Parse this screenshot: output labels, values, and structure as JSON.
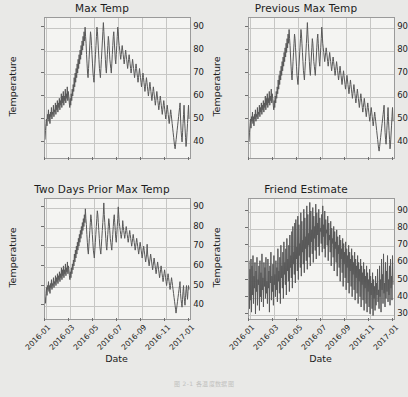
{
  "figure": {
    "caption": "图 2-1  各温度数据图",
    "background_color": "#e9e9e7",
    "plot_background_color": "#f4f4f2",
    "grid_color": "#c6c6c4",
    "line_color": "#595959"
  },
  "chart_data": [
    {
      "type": "line",
      "title": "Max Temp",
      "xlabel": "",
      "ylabel": "Temperature",
      "grid": true,
      "legend": "none",
      "ylim": [
        33,
        94
      ],
      "yticks": [
        40,
        50,
        60,
        70,
        80,
        90
      ],
      "xticks": [
        "2016-01",
        "2016-03",
        "2016-05",
        "2016-07",
        "2016-09",
        "2016-11",
        "2017-01"
      ],
      "x": [
        "2016-01-01",
        "2017-01-20"
      ],
      "values": [
        41,
        45,
        48,
        50,
        47,
        52,
        50,
        54,
        49,
        52,
        48,
        53,
        51,
        55,
        50,
        53,
        52,
        56,
        51,
        54,
        53,
        57,
        52,
        56,
        54,
        58,
        53,
        57,
        55,
        59,
        54,
        58,
        56,
        61,
        55,
        60,
        57,
        62,
        56,
        60,
        58,
        63,
        57,
        61,
        59,
        64,
        58,
        62,
        60,
        57,
        55,
        59,
        56,
        61,
        58,
        63,
        60,
        65,
        62,
        68,
        64,
        70,
        66,
        72,
        68,
        74,
        70,
        76,
        72,
        78,
        74,
        80,
        76,
        82,
        78,
        84,
        80,
        86,
        82,
        88,
        84,
        90,
        86,
        83,
        78,
        74,
        70,
        68,
        72,
        76,
        80,
        84,
        88,
        86,
        82,
        78,
        74,
        70,
        68,
        66,
        70,
        74,
        78,
        82,
        86,
        90,
        88,
        84,
        80,
        76,
        72,
        70,
        68,
        72,
        76,
        80,
        84,
        88,
        92,
        88,
        84,
        80,
        76,
        72,
        70,
        74,
        78,
        82,
        86,
        84,
        80,
        76,
        74,
        72,
        70,
        74,
        78,
        82,
        86,
        88,
        84,
        80,
        76,
        74,
        78,
        82,
        86,
        90,
        88,
        84,
        82,
        80,
        78,
        76,
        78,
        80,
        82,
        80,
        78,
        76,
        74,
        76,
        78,
        80,
        78,
        76,
        74,
        72,
        74,
        76,
        78,
        76,
        74,
        72,
        70,
        72,
        74,
        76,
        74,
        72,
        70,
        68,
        70,
        72,
        74,
        72,
        70,
        68,
        66,
        68,
        70,
        72,
        70,
        68,
        66,
        64,
        66,
        68,
        70,
        68,
        66,
        64,
        62,
        64,
        66,
        68,
        66,
        64,
        62,
        60,
        62,
        64,
        66,
        64,
        62,
        60,
        58,
        60,
        62,
        64,
        62,
        60,
        58,
        56,
        58,
        60,
        62,
        60,
        58,
        56,
        54,
        56,
        58,
        60,
        58,
        56,
        54,
        52,
        54,
        56,
        58,
        56,
        54,
        52,
        50,
        52,
        54,
        56,
        54,
        52,
        50,
        48,
        50,
        52,
        54,
        52,
        50,
        48,
        46,
        44,
        42,
        40,
        38,
        37,
        39,
        41,
        43,
        45,
        47,
        49,
        51,
        53,
        55,
        57,
        50,
        45,
        42,
        40,
        44,
        48,
        52,
        56,
        50,
        46,
        42,
        38,
        40,
        44,
        48,
        52,
        56,
        50
      ]
    },
    {
      "type": "line",
      "title": "Previous Max Temp",
      "xlabel": "",
      "ylabel": "Temperature",
      "grid": true,
      "legend": "none",
      "ylim": [
        33,
        94
      ],
      "yticks": [
        40,
        50,
        60,
        70,
        80,
        90
      ],
      "xticks": [
        "2016-01",
        "2016-03",
        "2016-05",
        "2016-07",
        "2016-09",
        "2016-11",
        "2017-01"
      ],
      "x": [
        "2016-01-01",
        "2017-01-20"
      ],
      "values": [
        40,
        44,
        47,
        50,
        46,
        51,
        49,
        53,
        48,
        51,
        47,
        52,
        50,
        54,
        49,
        52,
        51,
        55,
        50,
        53,
        52,
        56,
        51,
        55,
        53,
        57,
        52,
        56,
        54,
        58,
        53,
        57,
        55,
        60,
        54,
        59,
        56,
        61,
        55,
        59,
        57,
        62,
        56,
        60,
        58,
        63,
        57,
        61,
        59,
        56,
        54,
        58,
        55,
        60,
        57,
        62,
        59,
        64,
        61,
        67,
        63,
        69,
        65,
        71,
        67,
        73,
        69,
        75,
        71,
        77,
        73,
        79,
        75,
        81,
        77,
        83,
        79,
        85,
        81,
        87,
        83,
        89,
        85,
        82,
        77,
        73,
        69,
        67,
        71,
        75,
        79,
        83,
        87,
        85,
        81,
        77,
        73,
        69,
        67,
        65,
        69,
        73,
        77,
        81,
        85,
        89,
        87,
        83,
        79,
        75,
        71,
        69,
        67,
        71,
        75,
        79,
        83,
        87,
        92,
        87,
        83,
        79,
        75,
        71,
        69,
        73,
        77,
        81,
        85,
        83,
        79,
        75,
        73,
        71,
        69,
        73,
        77,
        81,
        85,
        87,
        83,
        79,
        75,
        73,
        77,
        81,
        85,
        90,
        87,
        83,
        81,
        79,
        77,
        75,
        77,
        79,
        81,
        79,
        77,
        75,
        73,
        75,
        77,
        79,
        77,
        75,
        73,
        71,
        73,
        75,
        77,
        75,
        73,
        71,
        69,
        71,
        73,
        75,
        73,
        71,
        69,
        67,
        69,
        71,
        73,
        71,
        69,
        67,
        65,
        67,
        69,
        71,
        69,
        67,
        65,
        63,
        65,
        67,
        69,
        67,
        65,
        63,
        61,
        63,
        65,
        67,
        65,
        63,
        61,
        59,
        61,
        63,
        65,
        63,
        61,
        59,
        57,
        59,
        61,
        63,
        61,
        59,
        57,
        55,
        57,
        59,
        61,
        59,
        57,
        55,
        53,
        55,
        57,
        59,
        57,
        55,
        53,
        51,
        53,
        55,
        57,
        55,
        53,
        51,
        49,
        51,
        53,
        55,
        53,
        51,
        49,
        47,
        49,
        51,
        53,
        51,
        49,
        47,
        45,
        43,
        41,
        39,
        37,
        36,
        38,
        40,
        42,
        44,
        46,
        48,
        50,
        52,
        54,
        56,
        49,
        44,
        41,
        39,
        43,
        47,
        51,
        55,
        49,
        45,
        41,
        37,
        39,
        43,
        47,
        51,
        55,
        49
      ]
    },
    {
      "type": "line",
      "title": "Two Days Prior Max Temp",
      "xlabel": "Date",
      "ylabel": "Temperature",
      "grid": true,
      "legend": "none",
      "ylim": [
        33,
        94
      ],
      "yticks": [
        40,
        50,
        60,
        70,
        80,
        90
      ],
      "xticks": [
        "2016-01",
        "2016-03",
        "2016-05",
        "2016-07",
        "2016-09",
        "2016-11",
        "2017-01"
      ],
      "x": [
        "2016-01-01",
        "2017-01-20"
      ],
      "values": [
        44,
        41,
        46,
        49,
        45,
        50,
        48,
        52,
        47,
        50,
        46,
        51,
        49,
        53,
        48,
        51,
        50,
        54,
        49,
        52,
        51,
        55,
        50,
        54,
        52,
        56,
        51,
        55,
        53,
        57,
        52,
        56,
        54,
        59,
        53,
        58,
        55,
        60,
        54,
        58,
        56,
        61,
        55,
        59,
        57,
        62,
        56,
        60,
        58,
        55,
        53,
        57,
        54,
        59,
        56,
        61,
        58,
        63,
        60,
        66,
        62,
        68,
        64,
        70,
        66,
        72,
        68,
        74,
        70,
        76,
        72,
        78,
        74,
        80,
        76,
        82,
        78,
        84,
        80,
        86,
        82,
        89,
        84,
        81,
        76,
        72,
        68,
        66,
        70,
        74,
        78,
        82,
        86,
        84,
        80,
        76,
        72,
        68,
        66,
        64,
        68,
        72,
        76,
        80,
        84,
        88,
        86,
        82,
        78,
        74,
        70,
        68,
        66,
        70,
        74,
        78,
        82,
        86,
        92,
        86,
        82,
        78,
        74,
        70,
        68,
        72,
        76,
        80,
        84,
        82,
        78,
        74,
        72,
        70,
        68,
        72,
        76,
        80,
        84,
        86,
        82,
        78,
        74,
        72,
        76,
        80,
        84,
        90,
        86,
        82,
        80,
        78,
        76,
        74,
        76,
        78,
        83,
        80,
        78,
        76,
        74,
        76,
        78,
        80,
        78,
        76,
        74,
        72,
        74,
        76,
        78,
        76,
        74,
        72,
        70,
        72,
        74,
        76,
        74,
        72,
        70,
        68,
        70,
        72,
        74,
        72,
        70,
        68,
        66,
        68,
        70,
        72,
        70,
        68,
        66,
        64,
        66,
        68,
        70,
        68,
        66,
        64,
        62,
        64,
        66,
        71,
        66,
        64,
        62,
        60,
        62,
        64,
        66,
        64,
        62,
        60,
        58,
        60,
        62,
        64,
        62,
        60,
        58,
        56,
        58,
        60,
        62,
        60,
        58,
        56,
        54,
        56,
        58,
        60,
        58,
        56,
        54,
        52,
        54,
        56,
        58,
        56,
        54,
        52,
        50,
        52,
        54,
        56,
        54,
        52,
        50,
        48,
        50,
        52,
        54,
        52,
        50,
        48,
        46,
        44,
        42,
        40,
        38,
        36,
        38,
        40,
        42,
        44,
        46,
        48,
        50,
        52,
        46,
        43,
        41,
        39,
        43,
        47,
        50,
        45,
        42,
        40,
        44,
        48,
        50,
        46,
        43,
        47,
        50,
        48
      ]
    },
    {
      "type": "line",
      "title": "Friend Estimate",
      "xlabel": "Date",
      "ylabel": "Temperature",
      "grid": true,
      "legend": "none",
      "ylim": [
        27,
        97
      ],
      "yticks": [
        30,
        40,
        50,
        60,
        70,
        80,
        90
      ],
      "xticks": [
        "2016-01",
        "2016-03",
        "2016-05",
        "2016-07",
        "2016-09",
        "2016-11",
        "2017-01"
      ],
      "x": [
        "2016-01-01",
        "2017-01-20"
      ],
      "values": [
        61,
        33,
        56,
        38,
        62,
        31,
        58,
        41,
        64,
        36,
        52,
        45,
        60,
        30,
        55,
        43,
        63,
        35,
        50,
        47,
        58,
        32,
        61,
        40,
        54,
        37,
        65,
        44,
        51,
        34,
        60,
        46,
        57,
        39,
        63,
        42,
        49,
        36,
        62,
        45,
        55,
        31,
        58,
        48,
        66,
        38,
        52,
        43,
        59,
        35,
        64,
        47,
        53,
        40,
        61,
        44,
        57,
        37,
        68,
        49,
        55,
        42,
        63,
        36,
        70,
        51,
        58,
        45,
        66,
        39,
        72,
        53,
        60,
        47,
        68,
        41,
        74,
        55,
        62,
        49,
        70,
        43,
        76,
        57,
        64,
        51,
        78,
        45,
        81,
        59,
        66,
        53,
        83,
        48,
        85,
        62,
        69,
        55,
        87,
        50,
        82,
        64,
        71,
        57,
        89,
        52,
        84,
        66,
        73,
        59,
        91,
        54,
        86,
        68,
        75,
        61,
        93,
        56,
        88,
        70,
        77,
        63,
        95,
        58,
        90,
        72,
        79,
        65,
        92,
        60,
        87,
        74,
        81,
        67,
        94,
        62,
        89,
        76,
        83,
        69,
        91,
        64,
        86,
        78,
        80,
        71,
        88,
        66,
        93,
        75,
        82,
        68,
        90,
        63,
        85,
        77,
        79,
        70,
        87,
        61,
        83,
        73,
        76,
        66,
        84,
        58,
        80,
        71,
        74,
        63,
        81,
        55,
        78,
        68,
        72,
        60,
        79,
        52,
        75,
        65,
        70,
        57,
        76,
        49,
        73,
        62,
        68,
        54,
        74,
        46,
        71,
        59,
        66,
        51,
        72,
        44,
        68,
        57,
        64,
        48,
        70,
        42,
        66,
        55,
        62,
        46,
        68,
        40,
        64,
        53,
        60,
        44,
        66,
        38,
        62,
        51,
        58,
        42,
        64,
        36,
        60,
        49,
        56,
        40,
        62,
        34,
        58,
        47,
        54,
        38,
        60,
        32,
        56,
        45,
        52,
        36,
        58,
        31,
        54,
        43,
        50,
        34,
        56,
        30,
        52,
        41,
        48,
        33,
        54,
        29,
        50,
        39,
        46,
        32,
        52,
        35,
        48,
        41,
        56,
        37,
        44,
        33,
        58,
        40,
        50,
        31,
        62,
        44,
        53,
        36,
        65,
        42,
        48,
        34,
        60,
        39,
        55,
        43,
        64,
        37,
        50,
        41,
        58,
        35,
        62,
        45,
        52,
        38,
        64,
        47
      ]
    }
  ]
}
